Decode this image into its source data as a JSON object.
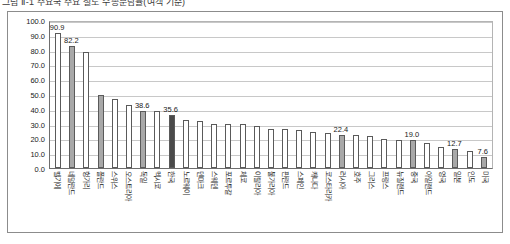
{
  "title": {
    "text": "그림 Ⅱ-1  주요국 주요 철도 수송분담률(여객 기준)"
  },
  "chart_data": {
    "type": "bar",
    "xlabel": "",
    "ylabel": "",
    "ylim": [
      0.0,
      100.0
    ],
    "ytick_labels": [
      "100.0",
      "90.0",
      "80.0",
      "70.0",
      "60.0",
      "50.0",
      "40.0",
      "30.0",
      "20.0",
      "10.0",
      "0.0"
    ],
    "ytick_values": [
      100.0,
      90.0,
      80.0,
      70.0,
      60.0,
      50.0,
      40.0,
      30.0,
      20.0,
      10.0,
      0.0
    ],
    "grid": true,
    "legend": "none",
    "categories": [
      "벨기에",
      "네덜란드",
      "헝가리",
      "폴란드",
      "스위스",
      "오스트리아",
      "독일",
      "멕시코",
      "한국",
      "노르웨이",
      "덴마크",
      "스웨덴",
      "포르투갈",
      "체코",
      "이탈리아",
      "불가리아",
      "핀란드",
      "스페인",
      "캐나다",
      "코스타리카",
      "러시아",
      "호주",
      "그리스",
      "프랑스",
      "뉴질랜드",
      "중국",
      "아일랜드",
      "영국",
      "일본",
      "인도",
      "미국"
    ],
    "values": [
      90.9,
      82.2,
      78.5,
      49.6,
      46.8,
      42.5,
      38.6,
      38.2,
      35.6,
      32.7,
      31.5,
      30.0,
      30.0,
      30.0,
      28.3,
      26.6,
      26.5,
      25.8,
      24.6,
      23.7,
      22.4,
      22.1,
      21.5,
      19.5,
      18.7,
      19.0,
      17.0,
      14.1,
      12.7,
      11.7,
      7.6
    ],
    "label_shown": [
      "90.9",
      "82.2",
      "",
      "",
      "",
      "",
      "38.6",
      "",
      "35.6",
      "",
      "",
      "",
      "",
      "",
      "",
      "",
      "",
      "",
      "",
      "",
      "22.4",
      "",
      "",
      "",
      "",
      "19.0",
      "",
      "",
      "12.7",
      "",
      "7.6"
    ],
    "bar_styles": [
      "plain",
      "mid",
      "plain",
      "mid",
      "plain",
      "plain",
      "mid",
      "plain",
      "dark",
      "plain",
      "plain",
      "plain",
      "plain",
      "plain",
      "plain",
      "plain",
      "plain",
      "plain",
      "plain",
      "plain",
      "mid",
      "plain",
      "plain",
      "plain",
      "plain",
      "mid",
      "plain",
      "plain",
      "mid",
      "plain",
      "mid"
    ],
    "colors": {
      "plain": "#ffffff",
      "mid": "#a8a8a8",
      "dark": "#4a4a4a",
      "bar_outline": "#5a5a5a",
      "gridline": "#c8c8c8",
      "axis": "#6e6e6e",
      "frame": "#8c8c8c",
      "text": "#1a1a1a",
      "background": "#ffffff"
    }
  }
}
